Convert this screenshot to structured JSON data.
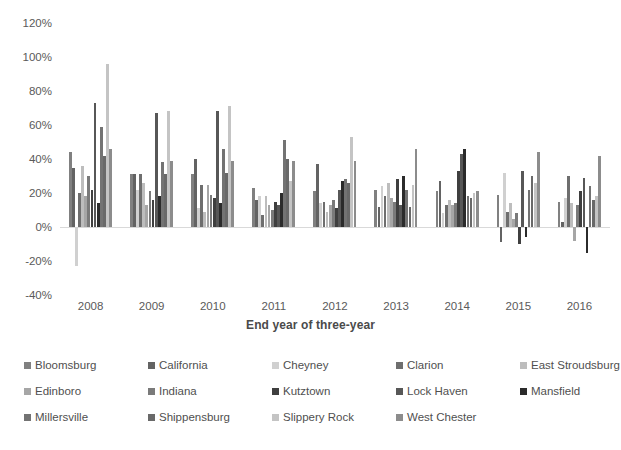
{
  "chart_data": {
    "type": "bar",
    "title": "",
    "xlabel": "End year of three-year",
    "ylabel": "",
    "categories": [
      "2008",
      "2009",
      "2010",
      "2011",
      "2012",
      "2013",
      "2014",
      "2015",
      "2016"
    ],
    "ylim": [
      -40,
      120
    ],
    "ytick_labels": [
      "120%",
      "100%",
      "80%",
      "60%",
      "40%",
      "20%",
      "0%",
      "-20%",
      "-40%"
    ],
    "ytick_values": [
      120,
      100,
      80,
      60,
      40,
      20,
      0,
      -20,
      -40
    ],
    "ytick_suffix": "%",
    "grid": false,
    "legend_position": "bottom",
    "series": [
      {
        "name": "Bloomsburg",
        "color": "#808080",
        "values": [
          44,
          31,
          31,
          23,
          21,
          22,
          21,
          19,
          15
        ]
      },
      {
        "name": "California",
        "color": "#636363",
        "values": [
          35,
          31,
          40,
          16,
          37,
          12,
          27,
          -9,
          3
        ]
      },
      {
        "name": "Cheyney",
        "color": "#d0d0d0",
        "values": [
          -23,
          22,
          11,
          18,
          14,
          24,
          8,
          32,
          17
        ]
      },
      {
        "name": "Clarion",
        "color": "#6e6e6e",
        "values": [
          20,
          31,
          25,
          7,
          15,
          18,
          13,
          9,
          30
        ]
      },
      {
        "name": "East Stroudsburg",
        "color": "#bdbdbd",
        "values": [
          36,
          26,
          9,
          18,
          9,
          26,
          16,
          14,
          14
        ]
      },
      {
        "name": "Edinboro",
        "color": "#a6a6a6",
        "values": [
          18,
          13,
          25,
          13,
          13,
          17,
          13,
          5,
          -8
        ]
      },
      {
        "name": "Indiana",
        "color": "#7a7a7a",
        "values": [
          30,
          21,
          19,
          10,
          16,
          15,
          14,
          8,
          13
        ]
      },
      {
        "name": "Kutztown",
        "color": "#3f3f3f",
        "values": [
          22,
          16,
          17,
          15,
          11,
          28,
          33,
          -10,
          21
        ]
      },
      {
        "name": "Lock Haven",
        "color": "#575757",
        "values": [
          73,
          67,
          68,
          13,
          22,
          13,
          43,
          33,
          29
        ]
      },
      {
        "name": "Mansfield",
        "color": "#2b2b2b",
        "values": [
          14,
          18,
          14,
          20,
          27,
          30,
          46,
          -6,
          -15
        ]
      },
      {
        "name": "Millersville",
        "color": "#737373",
        "values": [
          59,
          38,
          46,
          51,
          28,
          22,
          18,
          22,
          24
        ]
      },
      {
        "name": "Shippensburg",
        "color": "#696969",
        "values": [
          42,
          31,
          32,
          40,
          26,
          12,
          17,
          30,
          16
        ]
      },
      {
        "name": "Slippery Rock",
        "color": "#c4c4c4",
        "values": [
          96,
          68,
          71,
          27,
          53,
          25,
          20,
          26,
          18
        ]
      },
      {
        "name": "West Chester",
        "color": "#8c8c8c",
        "values": [
          46,
          39,
          39,
          39,
          39,
          46,
          21,
          44,
          42
        ]
      }
    ]
  },
  "axis": {
    "x_title": "End year of three-year"
  }
}
